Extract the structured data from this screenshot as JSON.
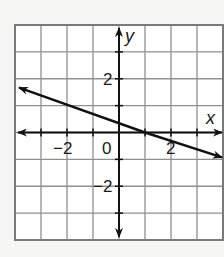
{
  "chart_data": {
    "type": "line",
    "title": "",
    "xlabel": "x",
    "ylabel": "y",
    "xlim": [
      -4,
      4
    ],
    "ylim": [
      -4,
      4
    ],
    "grid": true,
    "grid_step": 1,
    "x_tick_labels": [
      {
        "value": -2,
        "label": "−2"
      },
      {
        "value": 0,
        "label": "0"
      },
      {
        "value": 2,
        "label": "2"
      }
    ],
    "y_tick_labels": [
      {
        "value": 2,
        "label": "2"
      },
      {
        "value": -2,
        "label": "−2"
      }
    ],
    "series": [
      {
        "name": "line",
        "equation": "y = -x/3 + 1/3",
        "slope": -0.3333,
        "y_intercept": 0.3333,
        "x_intercept": 1,
        "points": [
          {
            "x": -4,
            "y": 1.667
          },
          {
            "x": 1,
            "y": 0
          },
          {
            "x": 4,
            "y": -1
          }
        ],
        "arrows_both_ends": true
      }
    ],
    "axes_arrows": true,
    "legend": null
  },
  "colors": {
    "background": "#f6f7f4",
    "plot_background": "#ffffff",
    "grid": "#8f8f8f",
    "border": "#7a7a7a",
    "axis": "#111111",
    "line": "#111111"
  }
}
